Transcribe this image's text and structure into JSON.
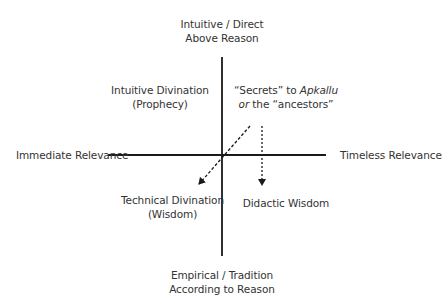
{
  "diagram": {
    "top_label": {
      "line1": "Intuitive / Direct",
      "line2": "Above Reason"
    },
    "bottom_label": {
      "line1": "Empirical / Tradition",
      "line2": "According to Reason"
    },
    "left_label": "Immediate Relevance",
    "right_label": "Timeless Relevance",
    "quadrants": {
      "upper_left": {
        "line1": "Intuitive Divination",
        "line2": "(Prophecy)"
      },
      "upper_right": {
        "line1_pre": "“Secrets” to ",
        "line1_italic": "Apkallu",
        "line2_italic": "or",
        "line2_post": " the “ancestors”"
      },
      "lower_left": {
        "line1": "Technical Divination",
        "line2": "(Wisdom)"
      },
      "lower_right": {
        "line1": "Didactic Wisdom"
      }
    },
    "arrows": [
      {
        "name": "to-technical-divination",
        "style": "dashed",
        "from": [
          250,
          126
        ],
        "to": [
          197,
          186
        ]
      },
      {
        "name": "to-didactic-wisdom",
        "style": "dashed",
        "from": [
          262,
          126
        ],
        "to": [
          262,
          187
        ]
      }
    ],
    "colors": {
      "axis": "#1a1a1a",
      "text": "#333333",
      "background": "#ffffff"
    }
  }
}
